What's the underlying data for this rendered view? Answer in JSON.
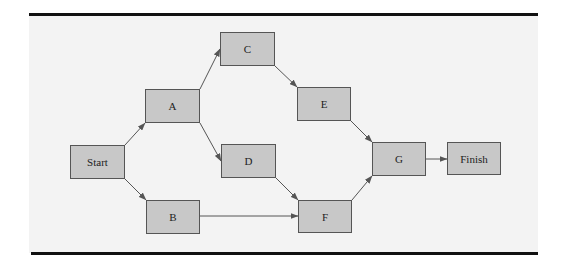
{
  "diagram": {
    "type": "activity-on-node network",
    "colors": {
      "panel_bg": "#f3f3f3",
      "rule": "#111111",
      "node_fill": "#c8c8c8",
      "node_border": "#555555",
      "edge": "#555555",
      "text": "#222222"
    },
    "nodes": [
      {
        "id": "start",
        "label": "Start",
        "x": 70,
        "y": 145,
        "w": 55,
        "h": 34
      },
      {
        "id": "a",
        "label": "A",
        "x": 145,
        "y": 89,
        "w": 55,
        "h": 34
      },
      {
        "id": "b",
        "label": "B",
        "x": 146,
        "y": 200,
        "w": 54,
        "h": 34
      },
      {
        "id": "c",
        "label": "C",
        "x": 220,
        "y": 32,
        "w": 55,
        "h": 34
      },
      {
        "id": "d",
        "label": "D",
        "x": 221,
        "y": 144,
        "w": 55,
        "h": 34
      },
      {
        "id": "e",
        "label": "E",
        "x": 297,
        "y": 87,
        "w": 54,
        "h": 34
      },
      {
        "id": "f",
        "label": "F",
        "x": 298,
        "y": 200,
        "w": 54,
        "h": 33
      },
      {
        "id": "g",
        "label": "G",
        "x": 372,
        "y": 142,
        "w": 54,
        "h": 34
      },
      {
        "id": "finish",
        "label": "Finish",
        "x": 447,
        "y": 142,
        "w": 54,
        "h": 33
      }
    ],
    "edges": [
      {
        "from": "start",
        "to": "a",
        "x1": 125,
        "y1": 145,
        "x2": 145,
        "y2": 123
      },
      {
        "from": "start",
        "to": "b",
        "x1": 125,
        "y1": 179,
        "x2": 146,
        "y2": 200
      },
      {
        "from": "a",
        "to": "c",
        "x1": 200,
        "y1": 89,
        "x2": 220,
        "y2": 49
      },
      {
        "from": "a",
        "to": "d",
        "x1": 200,
        "y1": 123,
        "x2": 221,
        "y2": 161
      },
      {
        "from": "c",
        "to": "e",
        "x1": 275,
        "y1": 66,
        "x2": 297,
        "y2": 87
      },
      {
        "from": "d",
        "to": "f",
        "x1": 276,
        "y1": 178,
        "x2": 298,
        "y2": 200
      },
      {
        "from": "b",
        "to": "f",
        "x1": 200,
        "y1": 216,
        "x2": 298,
        "y2": 216
      },
      {
        "from": "e",
        "to": "g",
        "x1": 351,
        "y1": 121,
        "x2": 372,
        "y2": 142
      },
      {
        "from": "f",
        "to": "g",
        "x1": 352,
        "y1": 200,
        "x2": 372,
        "y2": 176
      },
      {
        "from": "g",
        "to": "finish",
        "x1": 426,
        "y1": 159,
        "x2": 447,
        "y2": 159
      }
    ]
  }
}
